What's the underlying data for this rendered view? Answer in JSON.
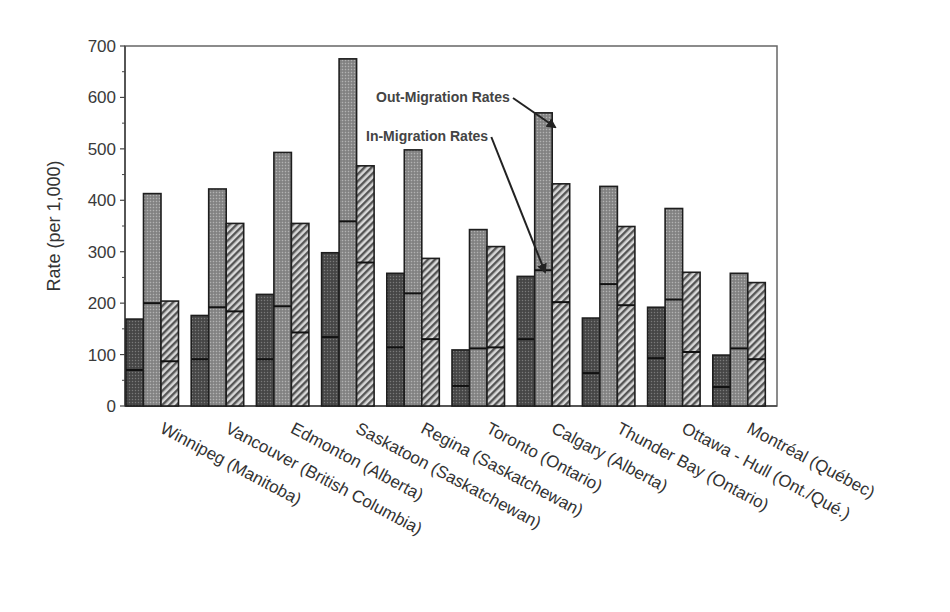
{
  "chart_data": {
    "type": "bar",
    "stacked_marker": true,
    "title": "",
    "xlabel": "",
    "ylabel": "Rate (per 1,000)",
    "ylim": [
      0,
      700
    ],
    "yticks": [
      0,
      100,
      200,
      300,
      400,
      500,
      600,
      700
    ],
    "grid": false,
    "legend": null,
    "categories": [
      "Winnipeg (Manitoba)",
      "Vancouver (British Columbia)",
      "Edmonton (Alberta)",
      "Saskatoon (Saskatchewan)",
      "Regina (Saskatchewan)",
      "Toronto (Ontario)",
      "Calgary (Alberta)",
      "Thunder Bay (Ontario)",
      "Ottawa - Hull (Ont./Qué.)",
      "Montréal (Québec)"
    ],
    "series": [
      {
        "name": "Series 1 (dark dotted)",
        "pattern": "dark-dots",
        "total_values": [
          169,
          176,
          217,
          298,
          258,
          109,
          252,
          171,
          192,
          99
        ],
        "in_migration_values": [
          70,
          91,
          91,
          134,
          114,
          39,
          130,
          64,
          93,
          37
        ]
      },
      {
        "name": "Series 2 (light dotted)",
        "pattern": "light-dots",
        "total_values": [
          413,
          422,
          493,
          675,
          498,
          343,
          570,
          427,
          384,
          258
        ],
        "in_migration_values": [
          200,
          192,
          194,
          359,
          219,
          112,
          264,
          237,
          207,
          112
        ]
      },
      {
        "name": "Series 3 (hatched)",
        "pattern": "hatch",
        "total_values": [
          204,
          355,
          355,
          467,
          287,
          310,
          432,
          349,
          260,
          240
        ],
        "in_migration_values": [
          87,
          184,
          143,
          279,
          130,
          114,
          202,
          196,
          105,
          91
        ]
      }
    ],
    "annotations": [
      {
        "text": "Out-Migration Rates",
        "points_to": "top of Calgary series 2 bar",
        "x": 376,
        "y": 102,
        "arrow_to": [
          555,
          127
        ]
      },
      {
        "text": "In-Migration Rates",
        "points_to": "divider line of Calgary series 2 bar",
        "x": 366,
        "y": 141,
        "arrow_to": [
          545,
          272
        ]
      }
    ]
  }
}
